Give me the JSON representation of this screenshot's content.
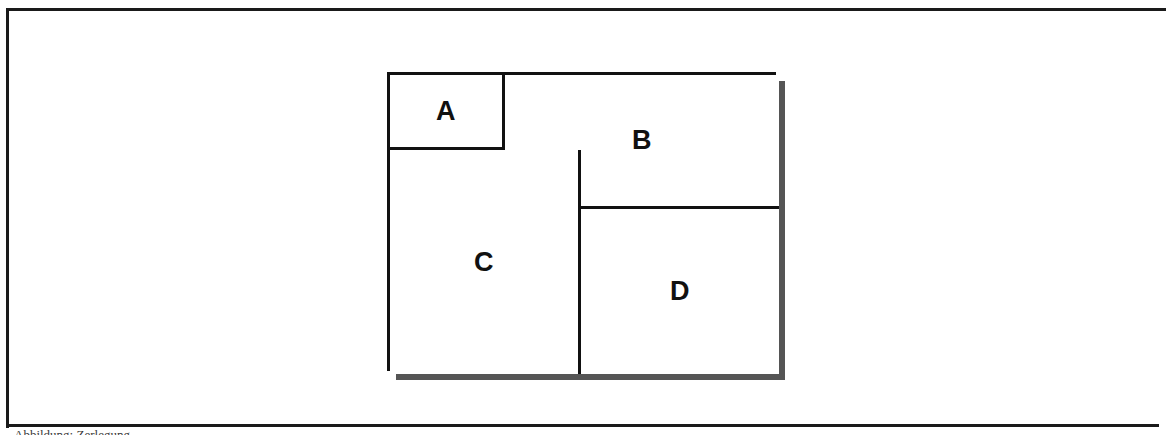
{
  "page": {
    "background_color": "#ffffff",
    "frame_color": "#1a1a1a"
  },
  "figure": {
    "name": "rectangle-dissection-diagram",
    "line_color": "#111111",
    "fill_color": "#ffffff",
    "shadow_color": "#555555",
    "regions": [
      {
        "id": "A",
        "label": "A"
      },
      {
        "id": "B",
        "label": "B"
      },
      {
        "id": "C",
        "label": "C"
      },
      {
        "id": "D",
        "label": "D"
      }
    ]
  },
  "caption": {
    "text": "Abbildung: Zerlegung"
  }
}
